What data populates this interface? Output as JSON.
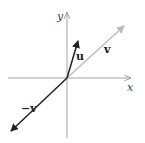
{
  "diagram": {
    "axes": {
      "x_label": "x",
      "y_label": "y"
    },
    "vectors": [
      {
        "name": "u",
        "label": "u",
        "color": "#222222"
      },
      {
        "name": "v",
        "label": "v",
        "color": "#b8b8b8"
      },
      {
        "name": "neg-v",
        "label": "−v",
        "color": "#222222"
      }
    ],
    "colors": {
      "axis": "#999999"
    }
  }
}
